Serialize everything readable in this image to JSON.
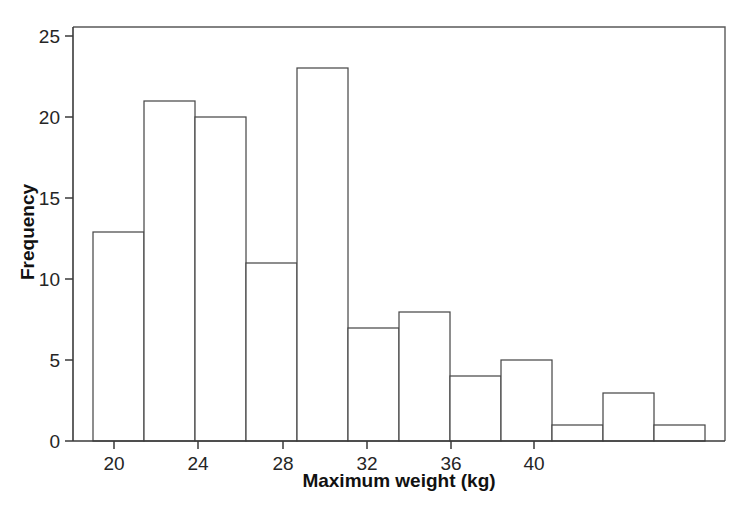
{
  "chart_data": {
    "type": "bar",
    "title": "",
    "subtitle": "",
    "xlabel": "Maximum weight (kg)",
    "ylabel": "Frequency",
    "xlim": [
      18.6,
      43.4
    ],
    "ylim": [
      0,
      25
    ],
    "grid": false,
    "legend": null,
    "x_ticks": [
      20,
      24,
      28,
      32,
      36,
      40
    ],
    "x_tick_labels": [
      "20",
      "24",
      "28",
      "32",
      "36",
      "40"
    ],
    "y_ticks": [
      0,
      5,
      10,
      15,
      20,
      25
    ],
    "y_tick_labels": [
      "0",
      "5",
      "10",
      "15",
      "20",
      "25"
    ],
    "bin_width": 2.4,
    "bin_edges": [
      19.0,
      21.4,
      23.8,
      26.2,
      28.6,
      31.0,
      33.4,
      35.8,
      38.2,
      40.6,
      43.0
    ],
    "bins": [
      {
        "left": 19.0,
        "right": 21.4,
        "count": 13
      },
      {
        "left": 21.4,
        "right": 23.8,
        "count": 21
      },
      {
        "left": 23.8,
        "right": 26.2,
        "count": 20
      },
      {
        "left": 26.2,
        "right": 28.6,
        "count": 11
      },
      {
        "left": 28.6,
        "right": 31.0,
        "count": 23
      },
      {
        "left": 31.0,
        "right": 33.4,
        "count": 7
      },
      {
        "left": 33.4,
        "right": 35.8,
        "count": 8
      },
      {
        "left": 35.8,
        "right": 38.2,
        "count": 4
      },
      {
        "left": 38.2,
        "right": 40.6,
        "count": 5
      },
      {
        "left": 40.6,
        "right": 43.0,
        "count": 1
      },
      {
        "left": 43.0,
        "right": 45.4,
        "count": 3
      },
      {
        "left": 45.4,
        "right": 47.8,
        "count": 1
      }
    ],
    "categories": [
      "19.0-21.4",
      "21.4-23.8",
      "23.8-26.2",
      "26.2-28.6",
      "28.6-31.0",
      "31.0-33.4",
      "33.4-35.8",
      "35.8-38.2",
      "38.2-40.6",
      "40.6-43.0",
      "43.0-45.4",
      "45.4-47.8"
    ],
    "values": [
      13,
      21,
      20,
      11,
      23,
      7,
      8,
      4,
      5,
      1,
      3,
      1
    ],
    "colors": {
      "bar_fill": "#ffffff",
      "bar_stroke": "#4a4a4a",
      "axis": "#3a3a3a",
      "frame": "#5a5a5a",
      "text": "#1a1a1a",
      "background": "#ffffff"
    }
  },
  "axes": {
    "x_title": "Maximum weight (kg)",
    "y_title": "Frequency"
  },
  "ticks": {
    "x": [
      {
        "label": "20",
        "px": 114
      },
      {
        "label": "24",
        "px": 198
      },
      {
        "label": "28",
        "px": 283
      },
      {
        "label": "32",
        "px": 367
      },
      {
        "label": "36",
        "px": 451
      },
      {
        "label": "40",
        "px": 534
      }
    ],
    "y": [
      {
        "label": "0",
        "px": 441
      },
      {
        "label": "5",
        "px": 360
      },
      {
        "label": "10",
        "px": 279
      },
      {
        "label": "15",
        "px": 198
      },
      {
        "label": "20",
        "px": 117
      },
      {
        "label": "25",
        "px": 36
      }
    ]
  },
  "bars_px": [
    {
      "x": 93,
      "w": 51,
      "top": 232,
      "count": 13
    },
    {
      "x": 144,
      "w": 51,
      "top": 101,
      "count": 21
    },
    {
      "x": 195,
      "w": 51,
      "top": 117,
      "count": 20
    },
    {
      "x": 246,
      "w": 51,
      "top": 263,
      "count": 11
    },
    {
      "x": 297,
      "w": 51,
      "top": 68,
      "count": 23
    },
    {
      "x": 348,
      "w": 51,
      "top": 328,
      "count": 7
    },
    {
      "x": 399,
      "w": 51,
      "top": 312,
      "count": 8
    },
    {
      "x": 450,
      "w": 51,
      "top": 376,
      "count": 4
    },
    {
      "x": 501,
      "w": 51,
      "top": 360,
      "count": 5
    },
    {
      "x": 552,
      "w": 51,
      "top": 425,
      "count": 1
    },
    {
      "x": 603,
      "w": 51,
      "top": 393,
      "count": 3
    },
    {
      "x": 654,
      "w": 51,
      "top": 425,
      "count": 1
    }
  ],
  "frame": {
    "left": 73,
    "right": 725,
    "top": 27,
    "bottom": 441
  }
}
